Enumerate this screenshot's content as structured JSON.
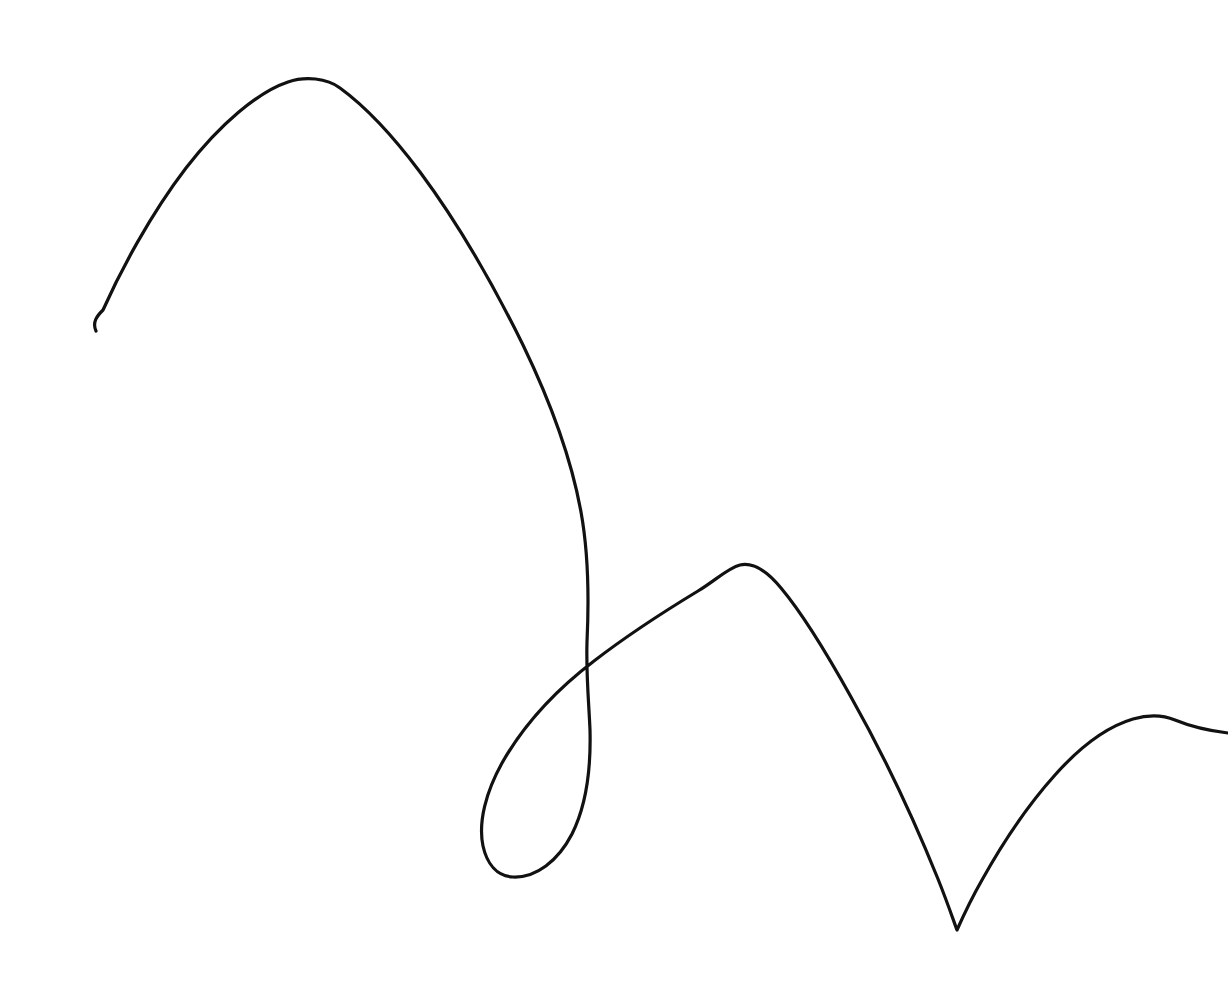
{
  "document": {
    "kind": "hand-drawn-line-sketch",
    "title": "Continuous single-stroke line drawing",
    "description": "A single unbroken hand-drawn pen line forming a tall left arch, a descending stem that loops back on itself, a medium middle arch, a sharp V valley, and a low right arch exiting the right edge.",
    "width": 1228,
    "height": 1000,
    "background_color": "#ffffff",
    "ink_color": "#111111",
    "stroke_width": 3.2,
    "stroke_count": 1,
    "text_content": "none"
  },
  "stroke": {
    "name": "continuous-pen-stroke",
    "start_point": {
      "x": 96,
      "y": 331,
      "label": "start-hook-lower-left"
    },
    "end_point": {
      "x": 1228,
      "y": 733,
      "label": "exits-right-edge"
    },
    "self_intersections": [
      {
        "x": 587,
        "y": 642,
        "label": "loop-crossing"
      }
    ],
    "features": [
      {
        "name": "start-hook",
        "type": "hook",
        "x": 96,
        "y": 331
      },
      {
        "name": "arch-1-peak",
        "type": "peak",
        "x": 312,
        "y": 79
      },
      {
        "name": "stem-descent",
        "type": "descent",
        "x": 580,
        "y": 450
      },
      {
        "name": "loop-crossing",
        "type": "crossing",
        "x": 587,
        "y": 642
      },
      {
        "name": "loop-bottom",
        "type": "valley",
        "x": 512,
        "y": 876
      },
      {
        "name": "loop-left-extreme",
        "type": "extremum",
        "x": 483,
        "y": 828
      },
      {
        "name": "arch-2-peak",
        "type": "peak",
        "x": 733,
        "y": 565
      },
      {
        "name": "valley-v-sharp",
        "type": "cusp",
        "x": 957,
        "y": 930
      },
      {
        "name": "arch-3-peak",
        "type": "peak",
        "x": 1152,
        "y": 717
      },
      {
        "name": "right-edge-exit",
        "type": "endpoint",
        "x": 1228,
        "y": 733
      }
    ],
    "path_d": "M 96 331 C 92 322 97 316 103 310 C 120 272 150 215 186 168 C 220 124 258 92 288 82 C 305 76 327 78 340 88 C 362 104 390 132 420 172 C 455 219 492 282 523 345 C 551 403 572 462 581 512 C 589 556 589 600 587 642 C 586 676 589 704 590 730 C 591 768 586 806 572 834 C 558 861 536 878 513 877 C 497 876 487 864 483 846 C 478 822 486 792 502 763 C 523 726 556 690 594 661 C 629 634 665 611 698 591 C 716 580 728 568 740 565 C 754 562 768 572 781 588 C 802 613 826 652 851 697 C 882 752 915 822 938 879 C 948 904 954 922 957 930 C 961 921 970 901 982 880 C 1002 844 1028 805 1055 775 C 1079 748 1106 727 1133 719 C 1147 715 1163 715 1175 720 C 1192 727 1211 731 1228 733"
  },
  "viewer": {
    "zoom_level": "100%",
    "canvas_label": "drawing-canvas"
  }
}
